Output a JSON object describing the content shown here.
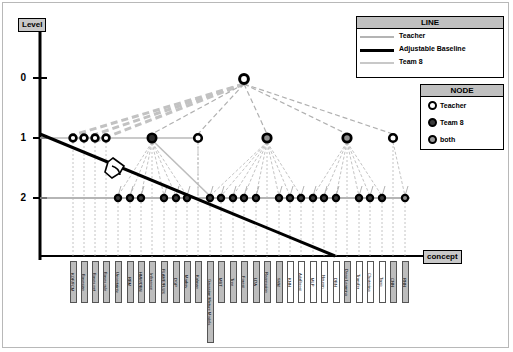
{
  "axis": {
    "y_axis_title": "Level",
    "y_ticks": [
      "0",
      "1",
      "2"
    ],
    "x_axis_title": "concept"
  },
  "legends": {
    "line": {
      "title": "LINE",
      "items": [
        {
          "label": "Teacher",
          "style": "teacher",
          "color": "#b4b4b4"
        },
        {
          "label": "Adjustable Baseline",
          "style": "baseline",
          "color": "#000000"
        },
        {
          "label": "Team 8",
          "style": "team",
          "color": "#c8c8c8"
        }
      ]
    },
    "node": {
      "title": "NODE",
      "items": [
        {
          "label": "Teacher",
          "style": "teacher"
        },
        {
          "label": "Team 8",
          "style": "team"
        },
        {
          "label": "both",
          "style": "both"
        }
      ]
    }
  },
  "chart_data": {
    "type": "scatter",
    "title": "",
    "xlabel": "concept",
    "ylabel": "Level",
    "ylim": [
      0,
      2
    ],
    "yticks": [
      0,
      1,
      2
    ],
    "grid": false,
    "legend_position": "top-right",
    "root": {
      "level": 0,
      "x": 244,
      "kind": "teacher"
    },
    "level1_nodes": [
      {
        "x": 73,
        "kind": "teacher"
      },
      {
        "x": 84,
        "kind": "teacher"
      },
      {
        "x": 95,
        "kind": "teacher"
      },
      {
        "x": 106,
        "kind": "teacher"
      },
      {
        "x": 152,
        "kind": "team"
      },
      {
        "x": 198,
        "kind": "teacher"
      },
      {
        "x": 267,
        "kind": "both"
      },
      {
        "x": 347,
        "kind": "both"
      },
      {
        "x": 393,
        "kind": "teacher"
      }
    ],
    "level2_nodes": [
      {
        "x": 118
      },
      {
        "x": 130
      },
      {
        "x": 141
      },
      {
        "x": 164
      },
      {
        "x": 176
      },
      {
        "x": 187
      },
      {
        "x": 210
      },
      {
        "x": 221
      },
      {
        "x": 233
      },
      {
        "x": 244
      },
      {
        "x": 256
      },
      {
        "x": 279
      },
      {
        "x": 290
      },
      {
        "x": 301
      },
      {
        "x": 313
      },
      {
        "x": 324
      },
      {
        "x": 336
      },
      {
        "x": 359
      },
      {
        "x": 370
      },
      {
        "x": 382
      },
      {
        "x": 405
      }
    ],
    "baseline": {
      "label": "Adjustable Baseline",
      "start": {
        "x": 40,
        "y": 134
      },
      "end": {
        "x": 335,
        "y": 256
      },
      "flat_end": {
        "x": 420,
        "y": 256
      }
    },
    "concept_labels": [
      {
        "text": "KOF/FCM",
        "fill": "gray"
      },
      {
        "text": "Bayesian",
        "fill": "gray"
      },
      {
        "text": "Bayes net",
        "fill": "gray"
      },
      {
        "text": "Bayes rule",
        "fill": "gray"
      },
      {
        "text": "Uncertainty",
        "fill": "gray"
      },
      {
        "text": "RBM",
        "fill": "gray"
      },
      {
        "text": "HMM/DBN",
        "fill": "gray"
      },
      {
        "text": "Inference",
        "fill": "gray"
      },
      {
        "text": "FLAME/FLUX",
        "fill": "gray"
      },
      {
        "text": "DGP",
        "fill": "gray"
      },
      {
        "text": "Markov",
        "fill": "gray"
      },
      {
        "text": "Kalman",
        "fill": "gray"
      },
      {
        "text": "Gaussian Mixture Models",
        "fill": "gray"
      },
      {
        "text": "MBT",
        "fill": "gray"
      },
      {
        "text": "Tree",
        "fill": "gray"
      },
      {
        "text": "Forest",
        "fill": "gray"
      },
      {
        "text": "LDA",
        "fill": "gray"
      },
      {
        "text": "Regression",
        "fill": "gray"
      },
      {
        "text": "SVM",
        "fill": "gray"
      },
      {
        "text": "KNN",
        "fill": "white"
      },
      {
        "text": "AdaBoost",
        "fill": "white"
      },
      {
        "text": "MLP",
        "fill": "white"
      },
      {
        "text": "Neuron",
        "fill": "white"
      },
      {
        "text": "DBN",
        "fill": "white"
      },
      {
        "text": "Deep Learning",
        "fill": "gray"
      },
      {
        "text": "Transfer",
        "fill": "white"
      },
      {
        "text": "Clustering",
        "fill": "white"
      },
      {
        "text": "Topic",
        "fill": "white"
      },
      {
        "text": "CNN",
        "fill": "gray"
      },
      {
        "text": "RNN",
        "fill": "gray"
      }
    ]
  }
}
